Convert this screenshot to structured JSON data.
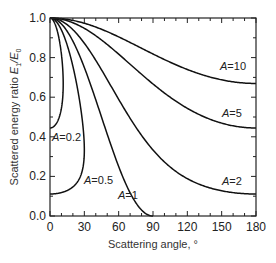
{
  "chart_data": {
    "type": "line",
    "title": "",
    "xlabel": "Scattering angle, °",
    "ylabel": "Scattered energy ratio E1/E0",
    "ylabel_parts": {
      "prefix": "Scattered energy ratio ",
      "e": "E",
      "sub1": "1",
      "slash": "/",
      "sub0": "0"
    },
    "xlim": [
      0,
      180
    ],
    "ylim": [
      0.0,
      1.0
    ],
    "x_ticks": [
      0,
      30,
      60,
      90,
      120,
      150,
      180
    ],
    "x_tick_labels": [
      "0",
      "30",
      "60",
      "90",
      "120",
      "150",
      "180"
    ],
    "y_ticks": [
      0.0,
      0.2,
      0.4,
      0.6,
      0.8,
      1.0
    ],
    "y_tick_labels": [
      "0.0",
      "0.2",
      "0.4",
      "0.6",
      "0.8",
      "1.0"
    ],
    "grid": false,
    "legend": "inline labels",
    "x": [
      0,
      30,
      60,
      90,
      120,
      150,
      180
    ],
    "series": [
      {
        "name": "A=10",
        "A": 10,
        "values": [
          1.0,
          0.974,
          0.905,
          0.818,
          0.74,
          0.688,
          0.669
        ],
        "label_pos": [
          220,
          70
        ]
      },
      {
        "name": "A=5",
        "A": 5,
        "values": [
          1.0,
          0.948,
          0.817,
          0.667,
          0.544,
          0.469,
          0.444
        ],
        "label_pos": [
          222,
          117
        ]
      },
      {
        "name": "A=2",
        "A": 2,
        "values": [
          1.0,
          0.872,
          0.589,
          0.333,
          0.189,
          0.127,
          0.111
        ],
        "label_pos": [
          222,
          185
        ]
      },
      {
        "name": "A=1",
        "A": 1,
        "values": [
          1.0,
          0.75,
          0.25,
          0.0,
          null,
          null,
          null
        ],
        "label_pos": [
          118,
          199
        ]
      },
      {
        "name": "A=0.5",
        "A": 0.5,
        "max_angle": 30,
        "upper_branch": {
          "x": [
            0,
            30
          ],
          "values": [
            1.0,
            0.333
          ]
        },
        "lower_branch": {
          "x": [
            0,
            30
          ],
          "values": [
            0.111,
            0.333
          ]
        },
        "label_pos": [
          84,
          184
        ]
      },
      {
        "name": "A=0.2",
        "A": 0.2,
        "max_angle": 11.5,
        "upper_branch": {
          "x": [
            0,
            11.5
          ],
          "values": [
            1.0,
            0.667
          ]
        },
        "lower_branch": {
          "x": [
            0,
            11.5
          ],
          "values": [
            0.444,
            0.667
          ]
        },
        "label_pos": [
          52,
          141
        ]
      }
    ]
  }
}
